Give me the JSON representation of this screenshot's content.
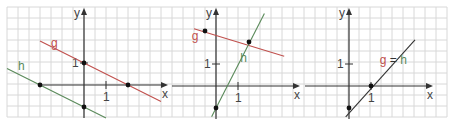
{
  "figure": {
    "background": "#ffffff",
    "grid": {
      "x0": 7,
      "y0": 7,
      "x1": 447,
      "y1": 117,
      "step": 11,
      "color": "#d8d8d8"
    },
    "unit_px": 22,
    "colors": {
      "axis": "#333333",
      "g": "#c0504d",
      "h": "#5a8a5a",
      "point": "#111111",
      "label_axis": "#444444"
    }
  },
  "panels": [
    {
      "id": "panel-1",
      "origin": [
        84,
        85
      ],
      "axis_x_label": "x",
      "axis_y_label": "y",
      "tick_label_x": "1",
      "tick_label_y": "1",
      "lines": [
        {
          "name": "g",
          "label": "g",
          "color_key": "g",
          "from": [
            -2.0,
            2.0
          ],
          "to": [
            3.5,
            -0.75
          ],
          "label_pos": [
            -1.5,
            1.75
          ]
        },
        {
          "name": "h",
          "label": "h",
          "color_key": "h",
          "from": [
            -3.5,
            0.75
          ],
          "to": [
            1.0,
            -1.5
          ],
          "label_pos": [
            -3.0,
            0.7
          ]
        }
      ],
      "points": [
        [
          0,
          1
        ],
        [
          2,
          0
        ],
        [
          -2,
          0
        ],
        [
          0,
          -1
        ]
      ]
    },
    {
      "id": "panel-2",
      "origin": [
        216,
        86
      ],
      "axis_x_label": "x",
      "axis_y_label": "y",
      "tick_label_x": "1",
      "tick_label_y": "1",
      "lines": [
        {
          "name": "g",
          "label": "g",
          "color_key": "g",
          "from": [
            -1.0,
            2.6
          ],
          "to": [
            3.1,
            1.35
          ],
          "label_pos": [
            -1.1,
            2.1
          ]
        },
        {
          "name": "h",
          "label": "h",
          "color_key": "h",
          "from": [
            -0.2,
            -1.4
          ],
          "to": [
            2.2,
            3.3
          ],
          "label_pos": [
            1.1,
            1.1
          ]
        }
      ],
      "points": [
        [
          -0.5,
          2.5
        ],
        [
          1.5,
          2
        ],
        [
          0,
          -1
        ]
      ]
    },
    {
      "id": "panel-3",
      "origin": [
        349,
        86
      ],
      "axis_x_label": "x",
      "axis_y_label": "y",
      "tick_label_x": "1",
      "tick_label_y": "1",
      "lines": [
        {
          "name": "g=h",
          "label": "",
          "color_key": "axis",
          "from": [
            -0.15,
            -1.4
          ],
          "to": [
            3.0,
            2.1
          ],
          "label_pos": [
            1.4,
            1.0
          ]
        }
      ],
      "combined_label": {
        "g": "g",
        "eq": "=",
        "h": "h",
        "pos": [
          1.4,
          1.0
        ]
      },
      "points": [
        [
          1,
          0
        ],
        [
          0,
          -1
        ]
      ]
    }
  ]
}
